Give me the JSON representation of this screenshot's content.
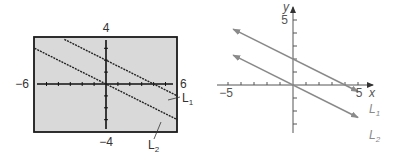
{
  "chart_data": [
    {
      "type": "line",
      "title": "",
      "style": "graphing-calculator screen",
      "window": {
        "xmin": -6,
        "xmax": 6,
        "ymin": -4,
        "ymax": 4,
        "xscl": 1,
        "yscl": 1
      },
      "tick_labels": {
        "xmin": "−6",
        "xmax": "6",
        "ymax": "4",
        "ymin": "−4"
      },
      "background": "#d9d9d9",
      "series": [
        {
          "name": "L₁",
          "label_main": "L",
          "label_sub": "1",
          "equation": "y = -x/2 + 2",
          "slope": -0.5,
          "intercept": 2,
          "x": [
            -3.5,
            6
          ],
          "y": [
            3.75,
            -1
          ]
        },
        {
          "name": "L₂",
          "label_main": "L",
          "label_sub": "2",
          "equation": "y = -x/2",
          "slope": -0.5,
          "intercept": 0,
          "x": [
            -6,
            6
          ],
          "y": [
            3,
            -3
          ]
        }
      ],
      "grid": false
    },
    {
      "type": "line",
      "title": "",
      "style": "textbook coordinate plane",
      "xlabel": "x",
      "ylabel": "y",
      "xlim": [
        -5.5,
        6
      ],
      "ylim": [
        -4,
        6
      ],
      "tick_labels": {
        "x_neg": "−5",
        "x_pos": "5",
        "y_pos": "5"
      },
      "series": [
        {
          "name": "L₁",
          "label_main": "L",
          "label_sub": "1",
          "equation": "y = -x/2 + 2",
          "slope": -0.5,
          "intercept": 2,
          "x": [
            -4.6,
            5
          ],
          "y": [
            4.3,
            -0.5
          ]
        },
        {
          "name": "L₂",
          "label_main": "L",
          "label_sub": "2",
          "equation": "y = -x/2",
          "slope": -0.5,
          "intercept": 0,
          "x": [
            -4.6,
            5
          ],
          "y": [
            2.3,
            -2.5
          ]
        }
      ],
      "line_color": "#8a8a8a",
      "grid": false
    }
  ]
}
